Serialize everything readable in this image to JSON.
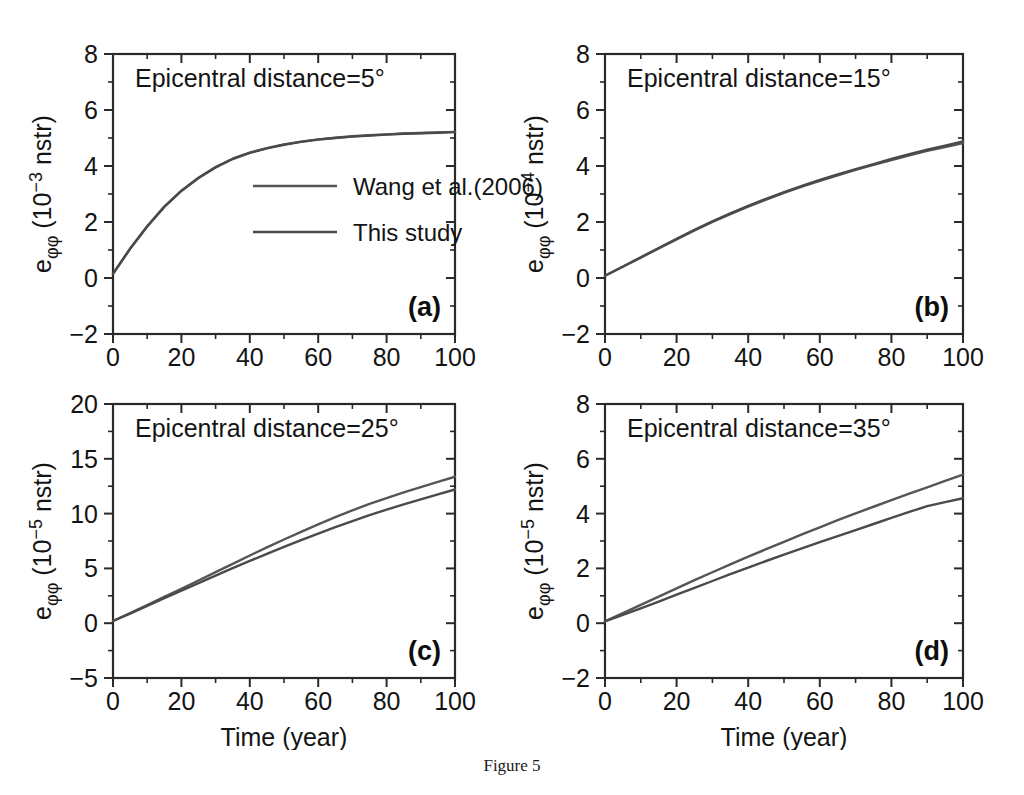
{
  "figure": {
    "caption": "Figure 5",
    "x_axis_label": "Time (year)",
    "legend": [
      {
        "label": "Wang et al.(2006)",
        "color": "#555555"
      },
      {
        "label": "This study",
        "color": "#4a4a4a"
      }
    ]
  },
  "chart_data": [
    {
      "type": "line",
      "panel": "(a)",
      "annotation": "Epicentral distance=5°",
      "title": "",
      "xlabel": "",
      "ylabel": "eφφ (10−3 nstr)",
      "ylabel_base": "e",
      "ylabel_sub": "φφ",
      "ylabel_mid": " (10",
      "ylabel_exp": "−3",
      "ylabel_tail": " nstr)",
      "xlim": [
        0,
        100
      ],
      "ylim": [
        -2,
        8
      ],
      "xticks": [
        0,
        20,
        40,
        60,
        80,
        100
      ],
      "yticks": [
        -2,
        0,
        2,
        4,
        6,
        8
      ],
      "xtick_labels": [
        "0",
        "20",
        "40",
        "60",
        "80",
        "100"
      ],
      "ytick_labels": [
        "−2",
        "0",
        "2",
        "4",
        "6",
        "8"
      ],
      "xminor_step": 10,
      "yminor_step": 1,
      "grid": false,
      "legend_position": "center",
      "x": [
        0,
        5,
        10,
        15,
        20,
        25,
        30,
        35,
        40,
        45,
        50,
        55,
        60,
        65,
        70,
        75,
        80,
        85,
        90,
        95,
        100
      ],
      "series": [
        {
          "name": "Wang et al.(2006)",
          "color": "#555555",
          "values": [
            0.15,
            1.05,
            1.85,
            2.55,
            3.12,
            3.58,
            3.96,
            4.26,
            4.48,
            4.64,
            4.77,
            4.87,
            4.95,
            5.01,
            5.06,
            5.1,
            5.13,
            5.16,
            5.18,
            5.2,
            5.22
          ]
        },
        {
          "name": "This study",
          "color": "#4a4a4a",
          "values": [
            0.15,
            1.04,
            1.84,
            2.54,
            3.11,
            3.57,
            3.95,
            4.25,
            4.47,
            4.63,
            4.76,
            4.86,
            4.94,
            5.0,
            5.05,
            5.09,
            5.12,
            5.15,
            5.17,
            5.19,
            5.21
          ]
        }
      ]
    },
    {
      "type": "line",
      "panel": "(b)",
      "annotation": "Epicentral distance=15°",
      "title": "",
      "xlabel": "",
      "ylabel": "eφφ (10−4 nstr)",
      "ylabel_base": "e",
      "ylabel_sub": "φφ",
      "ylabel_mid": " (10",
      "ylabel_exp": "−4",
      "ylabel_tail": " nstr)",
      "xlim": [
        0,
        100
      ],
      "ylim": [
        -2,
        8
      ],
      "xticks": [
        0,
        20,
        40,
        60,
        80,
        100
      ],
      "yticks": [
        -2,
        0,
        2,
        4,
        6,
        8
      ],
      "xtick_labels": [
        "0",
        "20",
        "40",
        "60",
        "80",
        "100"
      ],
      "ytick_labels": [
        "−2",
        "0",
        "2",
        "4",
        "6",
        "8"
      ],
      "xminor_step": 10,
      "yminor_step": 1,
      "grid": false,
      "legend_position": "none",
      "x": [
        0,
        5,
        10,
        15,
        20,
        25,
        30,
        35,
        40,
        45,
        50,
        55,
        60,
        65,
        70,
        75,
        80,
        85,
        90,
        95,
        100
      ],
      "series": [
        {
          "name": "Wang et al.(2006)",
          "color": "#555555",
          "values": [
            0.08,
            0.4,
            0.73,
            1.06,
            1.38,
            1.7,
            2.0,
            2.28,
            2.55,
            2.8,
            3.04,
            3.26,
            3.47,
            3.67,
            3.86,
            4.04,
            4.21,
            4.38,
            4.54,
            4.68,
            4.82
          ]
        },
        {
          "name": "This study",
          "color": "#4a4a4a",
          "values": [
            0.08,
            0.41,
            0.74,
            1.07,
            1.4,
            1.72,
            2.02,
            2.31,
            2.58,
            2.83,
            3.07,
            3.29,
            3.5,
            3.7,
            3.89,
            4.07,
            4.25,
            4.42,
            4.58,
            4.73,
            4.88
          ]
        }
      ]
    },
    {
      "type": "line",
      "panel": "(c)",
      "annotation": "Epicentral distance=25°",
      "title": "",
      "xlabel": "Time (year)",
      "ylabel": "eφφ (10−5 nstr)",
      "ylabel_base": "e",
      "ylabel_sub": "φφ",
      "ylabel_mid": " (10",
      "ylabel_exp": "−5",
      "ylabel_tail": " nstr)",
      "xlim": [
        0,
        100
      ],
      "ylim": [
        -5,
        20
      ],
      "xticks": [
        0,
        20,
        40,
        60,
        80,
        100
      ],
      "yticks": [
        -5,
        0,
        5,
        10,
        15,
        20
      ],
      "xtick_labels": [
        "0",
        "20",
        "40",
        "60",
        "80",
        "100"
      ],
      "ytick_labels": [
        "−5",
        "0",
        "5",
        "10",
        "15",
        "20"
      ],
      "xminor_step": 10,
      "yminor_step": 2.5,
      "grid": false,
      "legend_position": "none",
      "x": [
        0,
        5,
        10,
        15,
        20,
        25,
        30,
        35,
        40,
        45,
        50,
        55,
        60,
        65,
        70,
        75,
        80,
        85,
        90,
        95,
        100
      ],
      "series": [
        {
          "name": "Wang et al.(2006)",
          "color": "#555555",
          "values": [
            0.2,
            0.92,
            1.66,
            2.4,
            3.14,
            3.9,
            4.66,
            5.42,
            6.18,
            6.92,
            7.64,
            8.34,
            9.02,
            9.68,
            10.3,
            10.88,
            11.42,
            11.94,
            12.42,
            12.9,
            13.36
          ]
        },
        {
          "name": "This study",
          "color": "#4a4a4a",
          "values": [
            0.2,
            0.88,
            1.58,
            2.28,
            2.98,
            3.66,
            4.34,
            5.02,
            5.68,
            6.32,
            6.96,
            7.58,
            8.18,
            8.76,
            9.32,
            9.86,
            10.36,
            10.84,
            11.3,
            11.76,
            12.2
          ]
        }
      ]
    },
    {
      "type": "line",
      "panel": "(d)",
      "annotation": "Epicentral distance=35°",
      "title": "",
      "xlabel": "Time (year)",
      "ylabel": "eφφ (10−5 nstr)",
      "ylabel_base": "e",
      "ylabel_sub": "φφ",
      "ylabel_mid": " (10",
      "ylabel_exp": "−5",
      "ylabel_tail": " nstr)",
      "xlim": [
        0,
        100
      ],
      "ylim": [
        -2,
        8
      ],
      "xticks": [
        0,
        20,
        40,
        60,
        80,
        100
      ],
      "yticks": [
        -2,
        0,
        2,
        4,
        6,
        8
      ],
      "xtick_labels": [
        "0",
        "20",
        "40",
        "60",
        "80",
        "100"
      ],
      "ytick_labels": [
        "−2",
        "0",
        "2",
        "4",
        "6",
        "8"
      ],
      "xminor_step": 10,
      "yminor_step": 1,
      "grid": false,
      "legend_position": "none",
      "x": [
        0,
        5,
        10,
        15,
        20,
        25,
        30,
        35,
        40,
        45,
        50,
        55,
        60,
        65,
        70,
        75,
        80,
        85,
        90,
        95,
        100
      ],
      "series": [
        {
          "name": "Wang et al.(2006)",
          "color": "#555555",
          "values": [
            0.07,
            0.37,
            0.67,
            0.97,
            1.27,
            1.57,
            1.86,
            2.15,
            2.43,
            2.7,
            2.97,
            3.24,
            3.5,
            3.76,
            4.01,
            4.25,
            4.49,
            4.73,
            4.96,
            5.19,
            5.42
          ]
        },
        {
          "name": "This study",
          "color": "#4a4a4a",
          "values": [
            0.07,
            0.3,
            0.54,
            0.79,
            1.04,
            1.29,
            1.54,
            1.79,
            2.03,
            2.27,
            2.5,
            2.73,
            2.96,
            3.18,
            3.4,
            3.62,
            3.84,
            4.06,
            4.27,
            4.42,
            4.56
          ]
        }
      ]
    }
  ]
}
